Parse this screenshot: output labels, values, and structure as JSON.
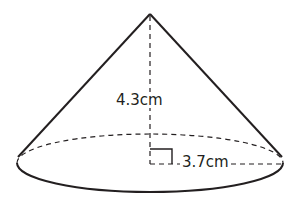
{
  "figure": {
    "shape": "right circular cone",
    "height_label": "4.3cm",
    "radius_label": "3.7cm",
    "height_value": 4.3,
    "radius_value": 3.7,
    "unit": "cm",
    "right_angle_marker": true,
    "stroke_color": "#231f20",
    "background_color": "#ffffff"
  }
}
